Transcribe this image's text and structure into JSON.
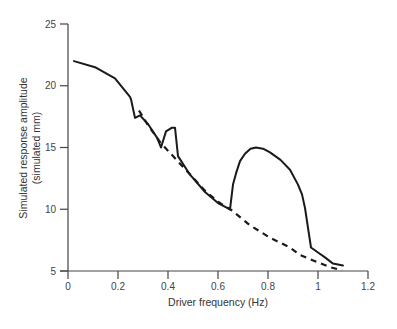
{
  "chart_data": {
    "type": "line",
    "title": "",
    "xlabel": "Driver frequency (Hz)",
    "ylabel_line1": "Simulated response amplitude",
    "ylabel_line2": "(simulated mm)",
    "xlim": [
      0,
      1.2
    ],
    "ylim": [
      5,
      25
    ],
    "xticks": [
      0,
      0.2,
      0.4,
      0.6,
      0.8,
      1,
      1.2
    ],
    "xtick_labels": [
      "0",
      "0.2",
      "0.4",
      "0.6",
      "0.8",
      "1",
      "1.2"
    ],
    "yticks": [
      5,
      10,
      15,
      20,
      25
    ],
    "ytick_labels": [
      "5",
      "10",
      "15",
      "20",
      "25"
    ],
    "grid": false,
    "legend": null,
    "series": [
      {
        "name": "Solid (simulated response)",
        "style": "solid",
        "color": "#1a1a1a",
        "points": [
          [
            0.024,
            22.0
          ],
          [
            0.108,
            21.5
          ],
          [
            0.188,
            20.6
          ],
          [
            0.248,
            19.1
          ],
          [
            0.252,
            18.9
          ],
          [
            0.268,
            17.4
          ],
          [
            0.288,
            17.6
          ],
          [
            0.32,
            16.9
          ],
          [
            0.356,
            15.8
          ],
          [
            0.372,
            15.0
          ],
          [
            0.392,
            16.3
          ],
          [
            0.416,
            16.6
          ],
          [
            0.428,
            16.6
          ],
          [
            0.44,
            14.3
          ],
          [
            0.488,
            12.8
          ],
          [
            0.548,
            11.4
          ],
          [
            0.6,
            10.5
          ],
          [
            0.648,
            10.0
          ],
          [
            0.66,
            12.0
          ],
          [
            0.672,
            12.9
          ],
          [
            0.688,
            13.9
          ],
          [
            0.708,
            14.5
          ],
          [
            0.73,
            14.9
          ],
          [
            0.752,
            15.0
          ],
          [
            0.78,
            14.9
          ],
          [
            0.808,
            14.6
          ],
          [
            0.85,
            14.0
          ],
          [
            0.888,
            13.2
          ],
          [
            0.92,
            12.0
          ],
          [
            0.936,
            11.2
          ],
          [
            0.948,
            10.1
          ],
          [
            0.96,
            8.5
          ],
          [
            0.972,
            6.9
          ],
          [
            1.0,
            6.5
          ],
          [
            1.028,
            6.1
          ],
          [
            1.06,
            5.6
          ],
          [
            1.1,
            5.45
          ]
        ]
      },
      {
        "name": "Dashed (baseline response)",
        "style": "dashed",
        "color": "#1a1a1a",
        "points": [
          [
            0.284,
            18.0
          ],
          [
            0.32,
            16.8
          ],
          [
            0.37,
            15.4
          ],
          [
            0.42,
            14.3
          ],
          [
            0.48,
            13.0
          ],
          [
            0.548,
            11.5
          ],
          [
            0.6,
            10.6
          ],
          [
            0.656,
            9.9
          ],
          [
            0.728,
            8.7
          ],
          [
            0.808,
            7.7
          ],
          [
            0.888,
            6.9
          ],
          [
            0.928,
            6.3
          ],
          [
            1.0,
            5.7
          ],
          [
            1.05,
            5.3
          ],
          [
            1.096,
            5.05
          ]
        ]
      }
    ]
  }
}
